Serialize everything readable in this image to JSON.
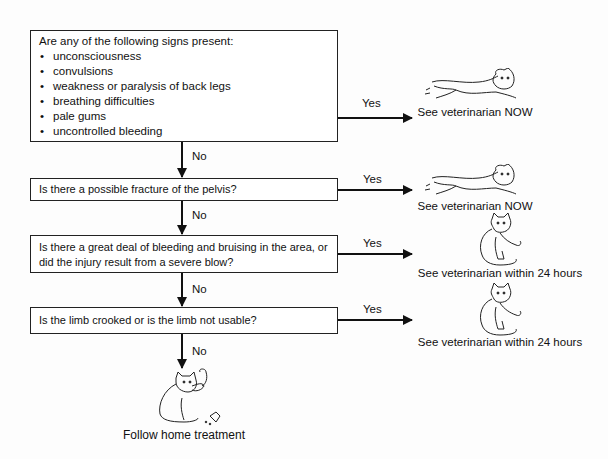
{
  "flowchart": {
    "questions": [
      {
        "text": "Are any of the following signs present:",
        "bullets": [
          "unconsciousness",
          "convulsions",
          "weakness or paralysis of back legs",
          "breathing difficulties",
          "pale gums",
          "uncontrolled bleeding"
        ]
      },
      {
        "text": "Is there a possible fracture of the pelvis?"
      },
      {
        "text": "Is there a great deal of bleeding and bruising in the area, or did the injury result from a severe blow?"
      },
      {
        "text": "Is the limb crooked or is the limb not usable?"
      }
    ],
    "yes_label": "Yes",
    "no_label": "No",
    "outcomes": [
      {
        "text": "See veterinarian NOW",
        "icon": "running-cat-icon"
      },
      {
        "text": "See veterinarian NOW",
        "icon": "running-cat-icon"
      },
      {
        "text": "See veterinarian within 24 hours",
        "icon": "sitting-cat-icon"
      },
      {
        "text": "See veterinarian within 24 hours",
        "icon": "sitting-cat-icon"
      }
    ],
    "final": {
      "text": "Follow home treatment",
      "icon": "cat-with-medicine-icon"
    }
  },
  "colors": {
    "line": "#111111",
    "box_border": "#222222",
    "background": "#fdfdfd"
  }
}
